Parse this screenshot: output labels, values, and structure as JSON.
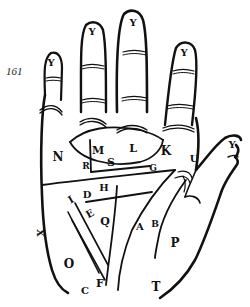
{
  "page": {
    "page_number": "161"
  },
  "colors": {
    "ink": "#111111",
    "paper": "#ffffff"
  },
  "labels": [
    {
      "id": "y-index",
      "text": "Y",
      "x": 51,
      "y": 63,
      "size": 10
    },
    {
      "id": "y-middle-left",
      "text": "Y",
      "x": 92,
      "y": 32,
      "size": 10
    },
    {
      "id": "y-middle",
      "text": "Y",
      "x": 133,
      "y": 23,
      "size": 10
    },
    {
      "id": "y-ring",
      "text": "Y",
      "x": 184,
      "y": 53,
      "size": 10
    },
    {
      "id": "y-thumb",
      "text": "Y",
      "x": 234,
      "y": 145,
      "size": 10
    },
    {
      "id": "n",
      "text": "N",
      "x": 58,
      "y": 157,
      "size": 12
    },
    {
      "id": "m",
      "text": "M",
      "x": 98,
      "y": 150,
      "size": 11
    },
    {
      "id": "l",
      "text": "L",
      "x": 133,
      "y": 148,
      "size": 11
    },
    {
      "id": "k",
      "text": "K",
      "x": 166,
      "y": 151,
      "size": 12
    },
    {
      "id": "u",
      "text": "U",
      "x": 194,
      "y": 159,
      "size": 10
    },
    {
      "id": "r",
      "text": "R",
      "x": 86,
      "y": 166,
      "size": 9
    },
    {
      "id": "s",
      "text": "S",
      "x": 111,
      "y": 162,
      "size": 11
    },
    {
      "id": "g",
      "text": "G",
      "x": 153,
      "y": 168,
      "size": 9
    },
    {
      "id": "h",
      "text": "H",
      "x": 104,
      "y": 188,
      "size": 10
    },
    {
      "id": "d",
      "text": "D",
      "x": 87,
      "y": 195,
      "size": 10
    },
    {
      "id": "i",
      "text": "I",
      "x": 71,
      "y": 200,
      "size": 10
    },
    {
      "id": "e",
      "text": "E",
      "x": 90,
      "y": 214,
      "size": 10
    },
    {
      "id": "q",
      "text": "Q",
      "x": 105,
      "y": 221,
      "size": 11
    },
    {
      "id": "a",
      "text": "A",
      "x": 140,
      "y": 227,
      "size": 10
    },
    {
      "id": "b",
      "text": "B",
      "x": 155,
      "y": 224,
      "size": 9
    },
    {
      "id": "p",
      "text": "P",
      "x": 175,
      "y": 243,
      "size": 12
    },
    {
      "id": "x",
      "text": "X",
      "x": 40,
      "y": 233,
      "size": 10
    },
    {
      "id": "o",
      "text": "O",
      "x": 69,
      "y": 264,
      "size": 12
    },
    {
      "id": "f",
      "text": "F",
      "x": 100,
      "y": 283,
      "size": 11
    },
    {
      "id": "c",
      "text": "C",
      "x": 85,
      "y": 291,
      "size": 10
    },
    {
      "id": "t",
      "text": "T",
      "x": 156,
      "y": 287,
      "size": 12
    }
  ]
}
